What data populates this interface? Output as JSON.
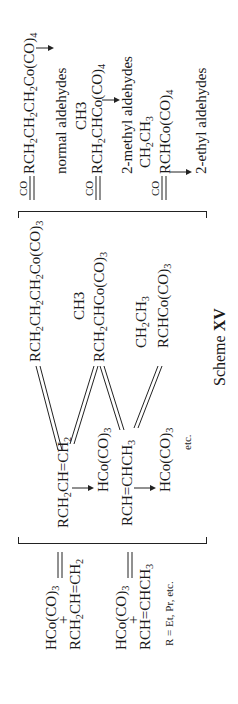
{
  "scheme": {
    "title_prefix": "Scheme",
    "title_number": "XV",
    "footnote": "R = Et, Pr, etc.",
    "etc_label": "etc.",
    "reactants": [
      {
        "metal": "HCo(CO)3",
        "plus": "+",
        "alkene": "RCH2CH=CH2"
      },
      {
        "metal": "HCo(CO)3",
        "plus": "+",
        "alkene": "RCH=CHCH3"
      }
    ],
    "equilibrium_arrow": "⇌",
    "pi_complexes": [
      {
        "alkene": "RCH2CH=CH2",
        "metal": "HCo(CO)3"
      },
      {
        "alkene": "RCH=CHCH3",
        "metal": "HCo(CO)3"
      }
    ],
    "alkyl_complexes": [
      {
        "formula": "RCH2CH2CH2Co(CO)3",
        "branch": ""
      },
      {
        "formula": "RCH2CHCo(CO)3",
        "branch": "CH3"
      },
      {
        "formula": "RCHCo(CO)3",
        "branch": "CH2CH3"
      }
    ],
    "co_label": "CO",
    "acyl_complexes": [
      {
        "formula": "RCH2CH2CH2Co(CO)4",
        "branch": "",
        "product": "normal aldehydes"
      },
      {
        "formula": "RCH2CHCo(CO)4",
        "branch": "CH3",
        "product": "2-methyl aldehydes"
      },
      {
        "formula": "RCHCo(CO)4",
        "branch": "CH2CH3",
        "product": "2-ethyl aldehydes"
      }
    ]
  }
}
